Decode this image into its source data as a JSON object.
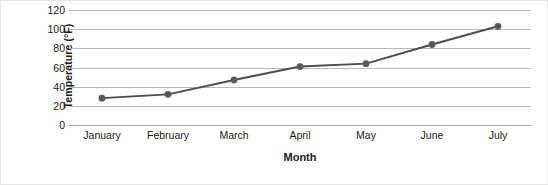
{
  "chart_data": {
    "type": "line",
    "title": "",
    "xlabel": "Month",
    "ylabel": "Temperature (°F)",
    "categories": [
      "January",
      "February",
      "March",
      "April",
      "May",
      "June",
      "July"
    ],
    "values": [
      28,
      32,
      47,
      61,
      64,
      84,
      103
    ],
    "series": [
      {
        "name": "Temperature",
        "values": [
          28,
          32,
          47,
          61,
          64,
          84,
          103
        ]
      }
    ],
    "ylim": [
      0,
      120
    ],
    "yticks": [
      0,
      20,
      40,
      60,
      80,
      100,
      120
    ],
    "ytick_labels": [
      "0",
      "20",
      "40",
      "60",
      "80",
      "100",
      "120"
    ],
    "grid": true,
    "grid_axis": "y",
    "legend": false,
    "legend_position": "none",
    "marker": "circle",
    "line_color": "#4d4d4d",
    "marker_color": "#595959",
    "grid_color": "#b9b9b9",
    "background_color": "#ffffff",
    "text_color": "#1a1a1a"
  }
}
